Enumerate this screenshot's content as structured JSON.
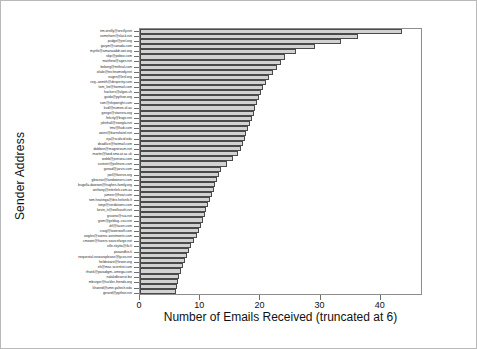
{
  "chart_data": {
    "type": "bar",
    "orientation": "horizontal",
    "title": "",
    "xlabel": "Number of Emails Received (truncated at 6)",
    "ylabel": "Sender Address",
    "xlim": [
      0,
      47
    ],
    "xticks": [
      0,
      10,
      20,
      30,
      40
    ],
    "grid": false,
    "legend": null,
    "bar_color": "#d2d2d2",
    "bar_edge_color": "#4a4a4a",
    "categories": [
      "tim.oreilly@oreilly.net",
      "somehorn@slack.net",
      "pudge@perl.org",
      "garym@canada.com",
      "myrtle@amanaaddr.iant.org",
      "skip@pobox.com",
      "matthew@agen.net",
      "beberg@mithral.com",
      "oliale@technomedy.net",
      "eugen@leitl.org",
      "ceg.-asmith@desperity.com",
      "tom_list@hotmail.com",
      "hackers@algos.ch",
      "guido@python.org",
      "ram@shipwright.com",
      "kvdl@numen.ol.au",
      "geege@starrera.org",
      "felicity@buge.net",
      "johnhall@swegla.net",
      "tmv@lludi.com",
      "owen@barnshotel.net",
      "eja@scalicid.edu",
      "deadlice@hotmail.com",
      "dobbzin@magnesium.net",
      "martin@land.smo.at.ac.uk",
      "webb@pensea.com",
      "sunnert@pelinore.com",
      "gonad@jarvis.com",
      "joel@faresis.org",
      "gbocear@landowners.com",
      "bugolla-dawson@hughes-family.org",
      "anthony@interlink.com.au",
      "jamesr@freat.com",
      "tom.heatinga@ibis.helsinki.fi",
      "tonyt@verdations.com",
      "kevin_tr@wellsouth.net",
      "gscono@rua.net",
      "gsim@geblog-.cou.net",
      "drl@lacon.com",
      "craig@lowerwolf.com",
      "angles@sanniv-westments.com",
      "cmxwin@fivzers.sourcefarge.net",
      "ville.skytta@iki.fi",
      "pasandhis.fi",
      "nequestal.roszaroplease@lycos.net",
      "heldeware@lexon.org",
      "eh@mac.scientist.com",
      "rfrank@paradigm--omega.com",
      "nalakdlevorut.biz",
      "mburger@tuckler-friends.org",
      "khanrid@umn.yaltech.edu",
      "gerard@python.net"
    ],
    "values": [
      43.9,
      36.4,
      33.6,
      29.3,
      26.1,
      24.3,
      23.6,
      22.9,
      22.2,
      21.6,
      21.1,
      20.6,
      20.2,
      19.9,
      19.6,
      19.3,
      19.0,
      18.7,
      18.4,
      18.1,
      17.8,
      17.5,
      17.2,
      16.9,
      16.4,
      15.6,
      14.6,
      13.6,
      13.2,
      12.9,
      12.6,
      12.3,
      12.0,
      11.7,
      11.4,
      11.1,
      10.8,
      10.5,
      10.2,
      9.9,
      9.5,
      9.1,
      8.6,
      8.2,
      7.8,
      7.5,
      7.2,
      6.9,
      6.6,
      6.4,
      6.2,
      6.1
    ]
  }
}
